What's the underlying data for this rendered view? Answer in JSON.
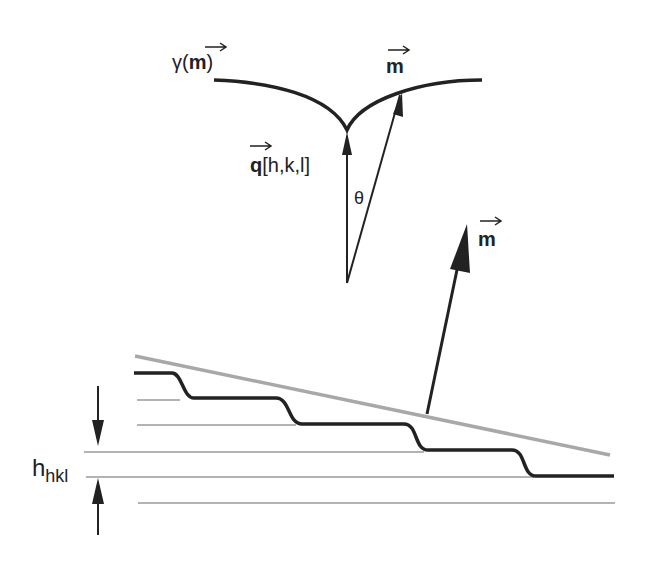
{
  "diagram": {
    "labels": {
      "gamma": "γ(",
      "gamma_m": "m",
      "gamma_close": ")",
      "m_top": "m",
      "q": "q",
      "q_indices": "[h,k,l]",
      "theta": "θ",
      "m_lower": "m",
      "h_main": "h",
      "h_sub": "hkl"
    },
    "colors": {
      "ink": "#222222",
      "surface_line": "#a8a8a8",
      "lattice_plane": "#9a9a9a"
    }
  }
}
